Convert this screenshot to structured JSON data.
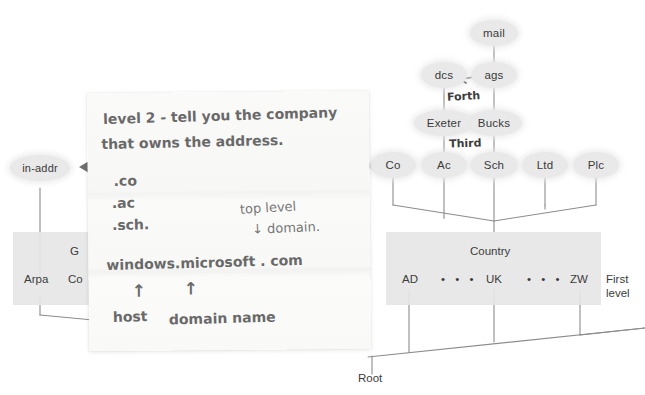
{
  "diagram": {
    "colors": {
      "node_fill": "#e9e9e9",
      "band_fill": "#e6e6e6",
      "line": "#8c8c8c",
      "text": "#3a3a3a",
      "ink": "#4a4a4a",
      "paper": "#f8f8f7"
    },
    "tree": {
      "top_node": {
        "label": "mail"
      },
      "fourth_level": [
        {
          "label": "dcs"
        },
        {
          "label": "ags"
        }
      ],
      "third_level": [
        {
          "label": "Exeter"
        },
        {
          "label": "Bucks"
        }
      ],
      "second_level": [
        {
          "label": "Co"
        },
        {
          "label": "Ac"
        },
        {
          "label": "Sch"
        },
        {
          "label": "Ltd"
        },
        {
          "label": "Plc"
        }
      ],
      "first_level": {
        "band_label": "Country",
        "level_label": "First\nlevel",
        "level_label_line1": "First",
        "level_label_line2": "level",
        "entries": [
          {
            "label": "AD"
          },
          {
            "label": "• • •"
          },
          {
            "label": "UK"
          },
          {
            "label": "• • •"
          },
          {
            "label": "ZW"
          }
        ]
      },
      "left_branch": {
        "node": {
          "label": "in-addr"
        },
        "band_label_partial": "G",
        "entries": [
          {
            "label": "Arpa"
          },
          {
            "label": "Co"
          }
        ]
      },
      "root": {
        "label": "Root"
      },
      "annotations": [
        {
          "label": "Forth",
          "note": "handwritten between dcs/ags and Exeter/Bucks"
        },
        {
          "label": "Third",
          "note": "handwritten below Exeter/Bucks"
        }
      ]
    },
    "note": {
      "lines": [
        {
          "text": "level 2 - tell you the company"
        },
        {
          "text": "that owns the address."
        },
        {
          "text": ".co"
        },
        {
          "text": ".ac"
        },
        {
          "text": ".sch."
        },
        {
          "text": "top level"
        },
        {
          "text": "↓ domain."
        },
        {
          "text": "windows.microsoft . com"
        },
        {
          "text": "↑"
        },
        {
          "text": "↑"
        },
        {
          "text": "host"
        },
        {
          "text": "domain name"
        }
      ],
      "text": {
        "l1": "level 2 -  tell you the company",
        "l2": "that owns the address.",
        "co": ".co",
        "ac": ".ac",
        "sch": ".sch.",
        "tld1": "top level",
        "tld2": "↓ domain.",
        "fqdn": "windows.microsoft . com",
        "arrow_host": "↑",
        "arrow_domain": "↑",
        "host": "host",
        "domain_name": "domain name"
      }
    }
  }
}
